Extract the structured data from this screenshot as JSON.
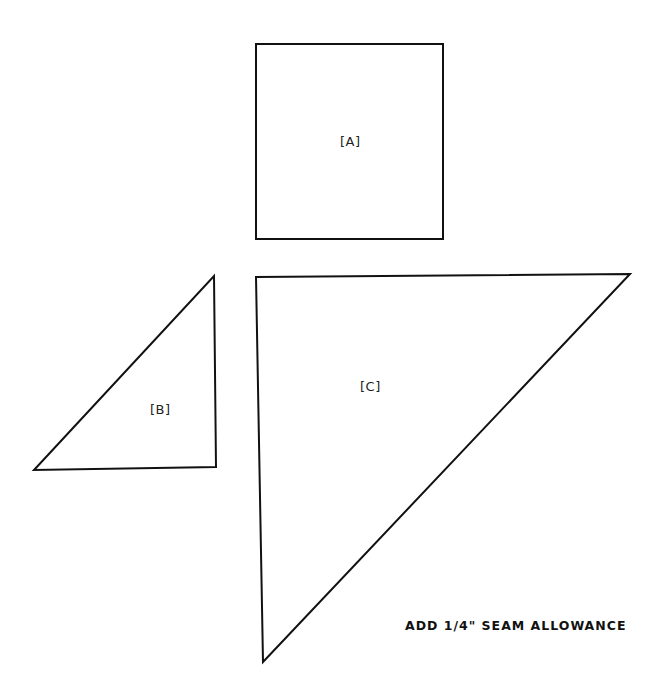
{
  "pattern": {
    "pieces": [
      {
        "id": "A",
        "label": "[A]",
        "shape": "square",
        "points": [
          [
            256,
            44
          ],
          [
            443,
            44
          ],
          [
            443,
            239
          ],
          [
            256,
            239
          ]
        ]
      },
      {
        "id": "B",
        "label": "[B]",
        "shape": "right-triangle",
        "points": [
          [
            214,
            276
          ],
          [
            216,
            467
          ],
          [
            34,
            470
          ]
        ]
      },
      {
        "id": "C",
        "label": "[C]",
        "shape": "right-triangle",
        "points": [
          [
            256,
            277
          ],
          [
            630,
            274
          ],
          [
            263,
            662
          ]
        ]
      }
    ],
    "note": "ADD 1/4\" SEAM ALLOWANCE",
    "stroke_color": "#111111"
  }
}
